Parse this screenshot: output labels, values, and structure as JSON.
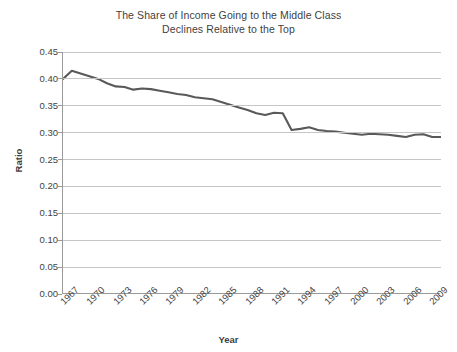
{
  "chart_data": {
    "type": "line",
    "title": "The Share of Income Going to the Middle Class Declines Relative to the Top",
    "title_lines": [
      "The Share of Income Going to the Middle Class",
      "Declines Relative to the Top"
    ],
    "xlabel": "Year",
    "ylabel": "Ratio",
    "ylim": [
      0.0,
      0.45
    ],
    "xlim": [
      1967,
      2010
    ],
    "grid": true,
    "legend": false,
    "legend_position": "none",
    "series_color": "#595959",
    "gridline_color": "#c6c6c6",
    "axis_color": "#9a9a9a",
    "text_color": "#3f3f3f",
    "y_ticks": [
      "0.00",
      "0.05",
      "0.10",
      "0.15",
      "0.20",
      "0.25",
      "0.30",
      "0.35",
      "0.40",
      "0.45"
    ],
    "y_tick_values": [
      0.0,
      0.05,
      0.1,
      0.15,
      0.2,
      0.25,
      0.3,
      0.35,
      0.4,
      0.45
    ],
    "x_ticks": [
      "1967",
      "1970",
      "1973",
      "1976",
      "1979",
      "1982",
      "1985",
      "1988",
      "1991",
      "1994",
      "1997",
      "2000",
      "2003",
      "2006",
      "2009"
    ],
    "x_tick_values": [
      1967,
      1970,
      1973,
      1976,
      1979,
      1982,
      1985,
      1988,
      1991,
      1994,
      1997,
      2000,
      2003,
      2006,
      2009
    ],
    "x": [
      1967,
      1968,
      1969,
      1970,
      1971,
      1972,
      1973,
      1974,
      1975,
      1976,
      1977,
      1978,
      1979,
      1980,
      1981,
      1982,
      1983,
      1984,
      1985,
      1986,
      1987,
      1988,
      1989,
      1990,
      1991,
      1992,
      1993,
      1994,
      1995,
      1996,
      1997,
      1998,
      1999,
      2000,
      2001,
      2002,
      2003,
      2004,
      2005,
      2006,
      2007,
      2008,
      2009,
      2010
    ],
    "series": [
      {
        "name": "Ratio",
        "values": [
          0.4,
          0.415,
          0.41,
          0.405,
          0.4,
          0.392,
          0.386,
          0.385,
          0.38,
          0.382,
          0.381,
          0.378,
          0.375,
          0.372,
          0.37,
          0.366,
          0.364,
          0.362,
          0.357,
          0.352,
          0.347,
          0.342,
          0.336,
          0.333,
          0.337,
          0.336,
          0.305,
          0.307,
          0.31,
          0.305,
          0.303,
          0.302,
          0.3,
          0.298,
          0.296,
          0.298,
          0.297,
          0.296,
          0.294,
          0.292,
          0.296,
          0.297,
          0.292,
          0.292
        ]
      }
    ]
  }
}
